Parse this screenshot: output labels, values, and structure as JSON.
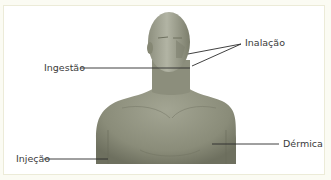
{
  "diagram": {
    "labels": {
      "inalacao": "Inalação",
      "ingestao": "Ingestão",
      "injecao": "Injeção",
      "dermica": "Dérmica"
    },
    "colors": {
      "background": "#fbfbf3",
      "frame": "#ffffff",
      "frame_border": "#ecebd8",
      "figure": "#8f917f",
      "leader_line": "#2b2b2b",
      "text": "#3a3a3a"
    }
  }
}
